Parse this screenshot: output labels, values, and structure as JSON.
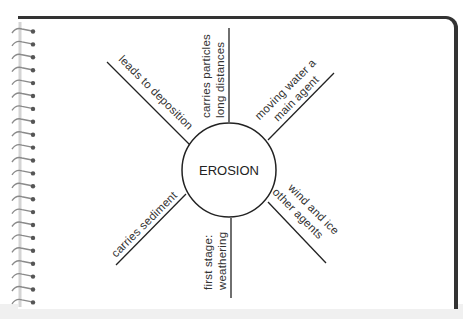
{
  "diagram": {
    "center": "EROSION",
    "spokes": [
      {
        "id": "top",
        "lines": [
          "carries particles",
          "long distances"
        ]
      },
      {
        "id": "top-left",
        "lines": [
          "leads to deposition"
        ]
      },
      {
        "id": "top-right",
        "lines": [
          "moving water a",
          "main agent"
        ]
      },
      {
        "id": "bottom-right",
        "lines": [
          "wind and ice",
          "other agents"
        ]
      },
      {
        "id": "bottom",
        "lines": [
          "first stage:",
          "weathering"
        ]
      },
      {
        "id": "bottom-left",
        "lines": [
          "carries sediment"
        ]
      }
    ]
  },
  "colors": {
    "line": "#222222",
    "frame": "#333333",
    "spiral": "#9a9a9a",
    "text": "#333333"
  }
}
